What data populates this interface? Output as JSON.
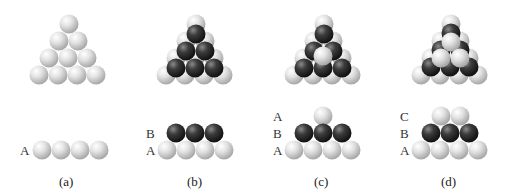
{
  "figure": {
    "panels": [
      {
        "id": "a",
        "caption": "(a)",
        "layers": [
          "A"
        ],
        "description": "Single close-packed layer A"
      },
      {
        "id": "b",
        "caption": "(b)",
        "layers": [
          "B",
          "A"
        ],
        "description": "Layer B placed in hollows of layer A"
      },
      {
        "id": "c",
        "caption": "(c)",
        "layers": [
          "A",
          "B",
          "A"
        ],
        "description": "Third layer directly over A: ABA (hexagonal close packing)"
      },
      {
        "id": "d",
        "caption": "(d)",
        "layers": [
          "C",
          "B",
          "A"
        ],
        "description": "Third layer in new positions C: ABC (cubic close packing)"
      }
    ],
    "colors": {
      "light_sphere": "#d8d8d8",
      "dark_sphere": "#3a3a3a",
      "background": "#ffffff"
    }
  }
}
